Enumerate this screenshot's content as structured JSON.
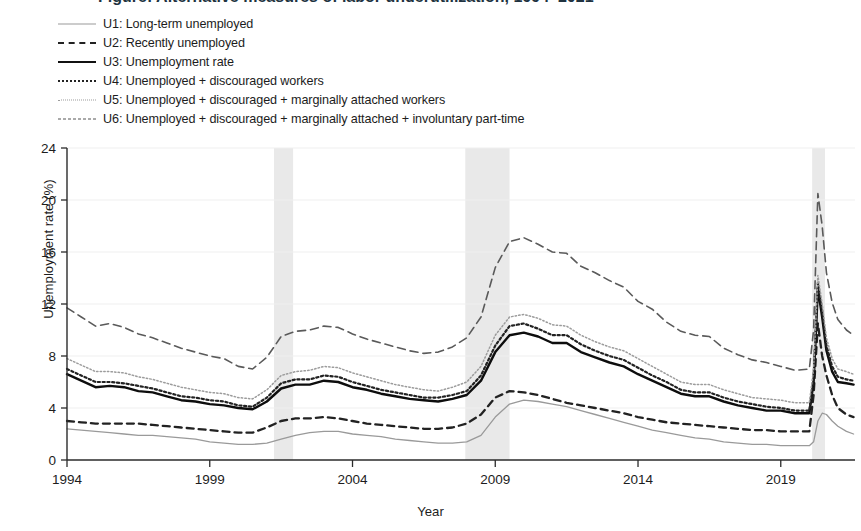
{
  "figure": {
    "title_cropped": "Figure: Alternative measures of labor underutilization, 1994–2021",
    "ylabel": "Unemployment rate (%)",
    "xlabel": "Year"
  },
  "legend": {
    "position": "top-left",
    "items": [
      {
        "key": "U1",
        "label": "U1: Long-term unemployed",
        "style": "solid-light",
        "color": "#9a9a9a",
        "sample": "ls-u1"
      },
      {
        "key": "U2",
        "label": "U2: Recently unemployed",
        "style": "dashed",
        "color": "#222222",
        "sample": "ls-u2"
      },
      {
        "key": "U3",
        "label": "U3: Unemployment rate",
        "style": "solid-bold",
        "color": "#111111",
        "sample": "ls-u3"
      },
      {
        "key": "U4",
        "label": "U4: Unemployed + discouraged workers",
        "style": "dotted",
        "color": "#222222",
        "sample": "ls-u4"
      },
      {
        "key": "U5",
        "label": "U5: Unemployed + discouraged + marginally attached workers",
        "style": "fine-dotted",
        "color": "#9c9c9c",
        "sample": "ls-u5"
      },
      {
        "key": "U6",
        "label": "U6: Unemployed + discouraged + marginally attached + involuntary part-time",
        "style": "long-dashed",
        "color": "#5a5a5a",
        "sample": "ls-u6"
      }
    ]
  },
  "chart_data": {
    "type": "line",
    "title": "",
    "xlabel": "Year",
    "ylabel": "Unemployment rate (%)",
    "xlim": [
      1994,
      2021.6
    ],
    "ylim": [
      0,
      24
    ],
    "ytick_labels": [
      "0",
      "4",
      "8",
      "12",
      "16",
      "20",
      "24"
    ],
    "yticks": [
      0,
      4,
      8,
      12,
      16,
      20,
      24
    ],
    "xtick_labels": [
      "1994",
      "1999",
      "2004",
      "2009",
      "2014",
      "2019"
    ],
    "xticks": [
      1994,
      1999,
      2004,
      2009,
      2014,
      2019
    ],
    "grid": "horizontal-light",
    "legend_position": "above-plot-left",
    "shaded_regions": [
      {
        "name": "recession-2001",
        "x0": 2001.25,
        "x1": 2001.92,
        "color": "#e9e9e9"
      },
      {
        "name": "recession-2008",
        "x0": 2007.95,
        "x1": 2009.5,
        "color": "#e9e9e9"
      },
      {
        "name": "recession-2020",
        "x0": 2020.1,
        "x1": 2020.55,
        "color": "#e9e9e9"
      }
    ],
    "x": [
      1994.0,
      1994.5,
      1995.0,
      1995.5,
      1996.0,
      1996.5,
      1997.0,
      1997.5,
      1998.0,
      1998.5,
      1999.0,
      1999.5,
      2000.0,
      2000.5,
      2001.0,
      2001.5,
      2002.0,
      2002.5,
      2003.0,
      2003.5,
      2004.0,
      2004.5,
      2005.0,
      2005.5,
      2006.0,
      2006.5,
      2007.0,
      2007.5,
      2008.0,
      2008.5,
      2009.0,
      2009.5,
      2010.0,
      2010.5,
      2011.0,
      2011.5,
      2012.0,
      2012.5,
      2013.0,
      2013.5,
      2014.0,
      2014.5,
      2015.0,
      2015.5,
      2016.0,
      2016.5,
      2017.0,
      2017.5,
      2018.0,
      2018.5,
      2019.0,
      2019.5,
      2020.0,
      2020.15,
      2020.3,
      2020.45,
      2020.6,
      2020.8,
      2021.0,
      2021.3,
      2021.55
    ],
    "series": [
      {
        "name": "U1: Long-term unemployed",
        "key": "U1",
        "values": [
          2.4,
          2.3,
          2.2,
          2.1,
          2.0,
          1.9,
          1.9,
          1.8,
          1.7,
          1.6,
          1.4,
          1.3,
          1.2,
          1.2,
          1.3,
          1.6,
          1.9,
          2.1,
          2.2,
          2.2,
          2.0,
          1.9,
          1.8,
          1.6,
          1.5,
          1.4,
          1.3,
          1.3,
          1.4,
          1.9,
          3.3,
          4.3,
          4.6,
          4.5,
          4.3,
          4.1,
          3.8,
          3.5,
          3.2,
          2.9,
          2.6,
          2.3,
          2.1,
          1.9,
          1.7,
          1.6,
          1.4,
          1.3,
          1.2,
          1.2,
          1.1,
          1.1,
          1.1,
          1.4,
          3.0,
          3.6,
          3.5,
          3.0,
          2.6,
          2.2,
          2.0
        ]
      },
      {
        "name": "U2: Recently unemployed",
        "key": "U2",
        "values": [
          3.0,
          2.9,
          2.8,
          2.8,
          2.8,
          2.8,
          2.7,
          2.6,
          2.5,
          2.4,
          2.3,
          2.2,
          2.1,
          2.1,
          2.5,
          3.0,
          3.2,
          3.2,
          3.3,
          3.2,
          3.0,
          2.8,
          2.7,
          2.6,
          2.5,
          2.4,
          2.4,
          2.5,
          2.8,
          3.5,
          4.8,
          5.3,
          5.2,
          5.0,
          4.7,
          4.4,
          4.2,
          4.0,
          3.8,
          3.6,
          3.3,
          3.1,
          2.9,
          2.8,
          2.7,
          2.6,
          2.5,
          2.4,
          2.3,
          2.3,
          2.2,
          2.2,
          2.2,
          5.0,
          10.5,
          8.0,
          6.5,
          5.0,
          4.0,
          3.5,
          3.3
        ]
      },
      {
        "name": "U3: Unemployment rate",
        "key": "U3",
        "values": [
          6.6,
          6.1,
          5.6,
          5.7,
          5.6,
          5.3,
          5.2,
          4.9,
          4.6,
          4.5,
          4.3,
          4.2,
          4.0,
          3.9,
          4.5,
          5.5,
          5.8,
          5.8,
          6.1,
          6.0,
          5.6,
          5.4,
          5.1,
          4.9,
          4.7,
          4.6,
          4.5,
          4.7,
          5.0,
          6.1,
          8.3,
          9.6,
          9.8,
          9.5,
          9.0,
          9.0,
          8.3,
          7.9,
          7.5,
          7.2,
          6.6,
          6.1,
          5.6,
          5.1,
          4.9,
          4.9,
          4.5,
          4.2,
          4.0,
          3.8,
          3.8,
          3.6,
          3.6,
          6.0,
          13.2,
          11.0,
          8.4,
          6.8,
          6.0,
          5.9,
          5.8
        ]
      },
      {
        "name": "U4: Unemployed + discouraged workers",
        "key": "U4",
        "values": [
          7.0,
          6.5,
          6.0,
          6.0,
          5.9,
          5.7,
          5.5,
          5.2,
          4.9,
          4.8,
          4.6,
          4.5,
          4.2,
          4.1,
          4.8,
          5.9,
          6.2,
          6.2,
          6.5,
          6.4,
          6.0,
          5.7,
          5.4,
          5.2,
          5.0,
          4.8,
          4.8,
          5.0,
          5.3,
          6.5,
          8.8,
          10.3,
          10.5,
          10.1,
          9.6,
          9.6,
          8.9,
          8.4,
          8.0,
          7.7,
          7.1,
          6.5,
          6.0,
          5.4,
          5.2,
          5.2,
          4.8,
          4.5,
          4.3,
          4.1,
          4.0,
          3.8,
          3.8,
          6.3,
          13.6,
          11.4,
          8.8,
          7.2,
          6.4,
          6.2,
          6.1
        ]
      },
      {
        "name": "U5: Unemployed + discouraged + marginally attached workers",
        "key": "U5",
        "values": [
          7.8,
          7.3,
          6.8,
          6.8,
          6.7,
          6.4,
          6.2,
          5.9,
          5.6,
          5.4,
          5.2,
          5.1,
          4.8,
          4.7,
          5.4,
          6.5,
          6.8,
          6.9,
          7.2,
          7.1,
          6.7,
          6.4,
          6.1,
          5.8,
          5.6,
          5.4,
          5.3,
          5.6,
          6.0,
          7.2,
          9.6,
          11.0,
          11.2,
          10.9,
          10.4,
          10.3,
          9.6,
          9.1,
          8.7,
          8.4,
          7.8,
          7.2,
          6.6,
          6.0,
          5.8,
          5.8,
          5.4,
          5.1,
          4.8,
          4.7,
          4.6,
          4.4,
          4.4,
          7.0,
          14.2,
          12.0,
          9.4,
          7.8,
          7.0,
          6.8,
          6.6
        ]
      },
      {
        "name": "U6: Unemployed + discouraged + marginally attached + involuntary part-time",
        "key": "U6",
        "values": [
          11.7,
          11.0,
          10.3,
          10.5,
          10.2,
          9.7,
          9.4,
          9.0,
          8.6,
          8.3,
          8.0,
          7.8,
          7.2,
          7.0,
          7.9,
          9.5,
          9.9,
          10.0,
          10.3,
          10.2,
          9.7,
          9.3,
          9.0,
          8.7,
          8.4,
          8.2,
          8.3,
          8.7,
          9.4,
          11.0,
          14.8,
          16.8,
          17.1,
          16.6,
          16.0,
          15.9,
          14.9,
          14.4,
          13.8,
          13.3,
          12.2,
          11.6,
          10.6,
          9.9,
          9.6,
          9.5,
          8.6,
          8.1,
          7.7,
          7.5,
          7.2,
          6.9,
          7.0,
          10.0,
          20.5,
          18.0,
          14.4,
          12.1,
          10.8,
          10.0,
          9.6
        ]
      }
    ]
  }
}
